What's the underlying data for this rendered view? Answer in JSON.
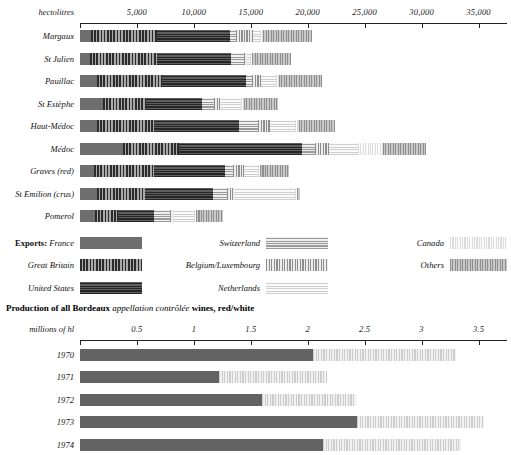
{
  "top_chart": {
    "unit_label": "hectolitres",
    "axis": {
      "min": 0,
      "max": 37500,
      "ticks": [
        0,
        5000,
        10000,
        15000,
        20000,
        25000,
        30000,
        35000
      ],
      "tick_labels": [
        "",
        "5,000",
        "10,000",
        "15,000",
        "20,000",
        "25,000",
        "30,000",
        "35,000"
      ]
    },
    "series_names": [
      "France",
      "Great Britain",
      "United States",
      "Switzerland",
      "Belgium/Luxembourg",
      "Netherlands",
      "Canada",
      "Others"
    ],
    "rows": [
      {
        "label": "Margaux",
        "values": [
          1000,
          5800,
          6400,
          500,
          1500,
          600,
          300,
          4300
        ]
      },
      {
        "label": "St Julien",
        "values": [
          900,
          5900,
          6500,
          1100,
          300,
          200,
          200,
          3400
        ]
      },
      {
        "label": "Pauillac",
        "values": [
          1500,
          5700,
          7400,
          500,
          800,
          1300,
          300,
          3800
        ]
      },
      {
        "label": "St Estèphe",
        "values": [
          2000,
          3800,
          4900,
          1100,
          600,
          1700,
          300,
          3000
        ]
      },
      {
        "label": "Haut-Médoc",
        "values": [
          1500,
          5000,
          7500,
          1600,
          1100,
          2200,
          300,
          3200
        ]
      },
      {
        "label": "Médoc",
        "values": [
          3800,
          4900,
          10800,
          1100,
          1300,
          2500,
          2200,
          3800
        ]
      },
      {
        "label": "Graves (red)",
        "values": [
          1200,
          5300,
          6200,
          700,
          1000,
          1200,
          200,
          2600
        ]
      },
      {
        "label": "St Emilion (crus)",
        "values": [
          1500,
          4200,
          6000,
          1200,
          600,
          5400,
          200,
          200
        ]
      },
      {
        "label": "Pomerol",
        "values": [
          1300,
          2000,
          3200,
          1400,
          300,
          1800,
          200,
          2400
        ]
      }
    ]
  },
  "legend": {
    "exports_prefix": "Exports:",
    "columns": [
      [
        {
          "name": "France",
          "pattern": "p-france",
          "lead": true
        },
        {
          "name": "Great Britain",
          "pattern": "p-gb",
          "lead": false
        },
        {
          "name": "United States",
          "pattern": "p-us",
          "lead": false
        }
      ],
      [
        {
          "name": "Switzerland",
          "pattern": "p-swiss",
          "lead": false
        },
        {
          "name": "Belgium/Luxembourg",
          "pattern": "p-belux",
          "lead": false
        },
        {
          "name": "Netherlands",
          "pattern": "p-neth",
          "lead": false
        }
      ],
      [
        {
          "name": "Canada",
          "pattern": "p-canada",
          "lead": false
        },
        {
          "name": "Others",
          "pattern": "p-others",
          "lead": false
        }
      ]
    ]
  },
  "bottom_chart": {
    "title_parts": {
      "before": "Production of all Bordeaux ",
      "italic": "appellation contrôlée",
      "after": " wines, red/white"
    },
    "unit_label": "millions of hl",
    "axis": {
      "min": 0,
      "max": 3.75,
      "ticks": [
        0,
        0.5,
        1,
        1.5,
        2,
        2.5,
        3,
        3.5
      ],
      "tick_labels": [
        "",
        "0.5",
        "1",
        "1.5",
        "2",
        "2.5",
        "3",
        "3.5"
      ]
    },
    "series_names": [
      "red",
      "white"
    ],
    "rows": [
      {
        "label": "1970",
        "values": [
          2.05,
          1.25
        ]
      },
      {
        "label": "1971",
        "values": [
          1.22,
          0.95
        ]
      },
      {
        "label": "1972",
        "values": [
          1.6,
          0.82
        ]
      },
      {
        "label": "1973",
        "values": [
          2.43,
          1.12
        ]
      },
      {
        "label": "1974",
        "values": [
          2.13,
          1.22
        ]
      }
    ]
  },
  "chart_data": {
    "type": "bar",
    "charts": [
      {
        "type": "bar",
        "orientation": "horizontal",
        "stacked": true,
        "title": "",
        "xlabel": "hectolitres",
        "ylabel": "",
        "xlim": [
          0,
          37500
        ],
        "xticks": [
          0,
          5000,
          10000,
          15000,
          20000,
          25000,
          30000,
          35000
        ],
        "categories": [
          "Margaux",
          "St Julien",
          "Pauillac",
          "St Estèphe",
          "Haut-Médoc",
          "Médoc",
          "Graves (red)",
          "St Emilion (crus)",
          "Pomerol"
        ],
        "series": [
          {
            "name": "France",
            "values": [
              1000,
              900,
              1500,
              2000,
              1500,
              3800,
              1200,
              1500,
              1300
            ]
          },
          {
            "name": "Great Britain",
            "values": [
              5800,
              5900,
              5700,
              3800,
              5000,
              4900,
              5300,
              4200,
              2000
            ]
          },
          {
            "name": "United States",
            "values": [
              6400,
              6500,
              7400,
              4900,
              7500,
              10800,
              6200,
              6000,
              3200
            ]
          },
          {
            "name": "Switzerland",
            "values": [
              500,
              1100,
              500,
              1100,
              1600,
              1100,
              700,
              1200,
              1400
            ]
          },
          {
            "name": "Belgium/Luxembourg",
            "values": [
              1500,
              300,
              800,
              600,
              1100,
              1300,
              1000,
              600,
              300
            ]
          },
          {
            "name": "Netherlands",
            "values": [
              600,
              200,
              1300,
              1700,
              2200,
              2500,
              1200,
              5400,
              1800
            ]
          },
          {
            "name": "Canada",
            "values": [
              300,
              200,
              300,
              300,
              300,
              2200,
              200,
              200,
              200
            ]
          },
          {
            "name": "Others",
            "values": [
              4300,
              3400,
              3800,
              3000,
              3200,
              3800,
              2600,
              200,
              2400
            ]
          }
        ],
        "totals": [
          20400,
          18500,
          21300,
          17400,
          22400,
          30400,
          18400,
          19300,
          12600
        ],
        "legend_position": "below",
        "grid": false
      },
      {
        "type": "bar",
        "orientation": "horizontal",
        "stacked": true,
        "title": "Production of all Bordeaux appellation contrôlée wines, red/white",
        "xlabel": "millions of hl",
        "ylabel": "",
        "xlim": [
          0,
          3.75
        ],
        "xticks": [
          0,
          0.5,
          1,
          1.5,
          2,
          2.5,
          3,
          3.5
        ],
        "categories": [
          "1970",
          "1971",
          "1972",
          "1973",
          "1974"
        ],
        "series": [
          {
            "name": "red",
            "values": [
              2.05,
              1.22,
              1.6,
              2.43,
              2.13
            ]
          },
          {
            "name": "white",
            "values": [
              1.25,
              0.95,
              0.82,
              1.12,
              1.22
            ]
          }
        ],
        "totals": [
          3.3,
          2.17,
          2.42,
          3.55,
          3.35
        ],
        "legend_position": "none",
        "grid": false
      }
    ]
  }
}
